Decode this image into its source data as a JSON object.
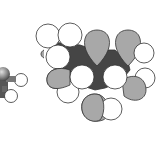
{
  "figure": {
    "colors": {
      "background": "#ffffff",
      "light_lobe": "#ffffff",
      "grey_lobe": "#a8a8a8",
      "dark_core": "#454545",
      "outline": "#333333",
      "sphere_grey": "#8a8a8a"
    }
  }
}
